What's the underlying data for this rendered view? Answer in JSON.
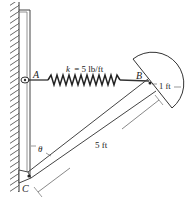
{
  "figure": {
    "points": {
      "A": {
        "label": "A"
      },
      "B": {
        "label": "B"
      },
      "C": {
        "label": "C"
      }
    },
    "spring": {
      "label": "k = 5 lb/ft",
      "k_symbol": "k",
      "k_value": "= 5 lb/ft"
    },
    "dimensions": {
      "rod_length": "5 ft",
      "radius": "1 ft"
    },
    "angle": {
      "symbol": "θ"
    },
    "colors": {
      "line": "#333333",
      "hatch": "#555555",
      "background": "#ffffff"
    }
  }
}
